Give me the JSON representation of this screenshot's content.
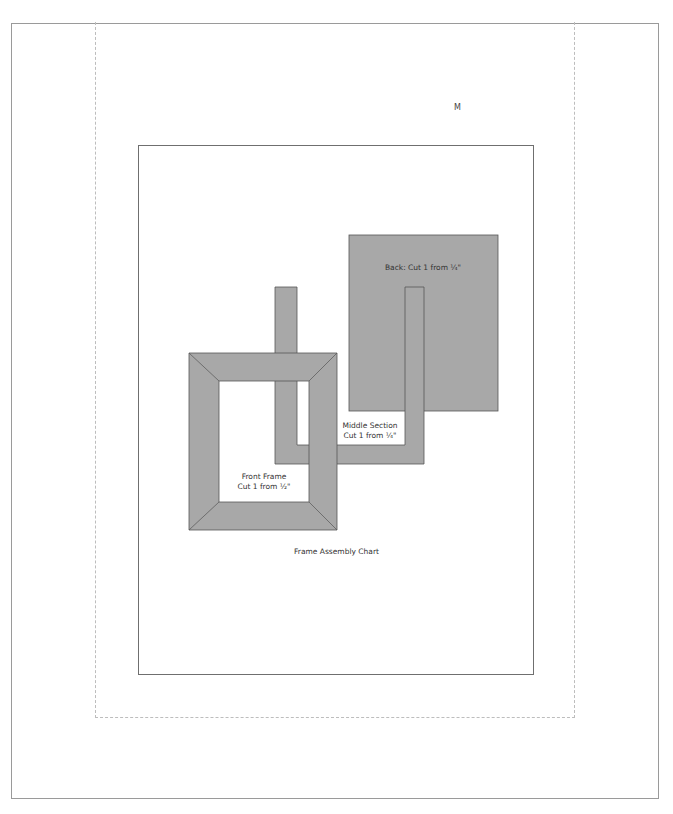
{
  "page": {
    "corner_marker": "M",
    "caption": "Frame Assembly Chart"
  },
  "parts": {
    "back": {
      "label": "Back: Cut 1 from ¼\""
    },
    "middle": {
      "label_line1": "Middle Section",
      "label_line2": "Cut 1 from ¼\""
    },
    "front": {
      "label_line1": "Front Frame",
      "label_line2": "Cut 1 from ½\""
    }
  },
  "colors": {
    "part_fill": "#a8a8a8",
    "part_stroke": "#555555",
    "border": "#9a9a9a",
    "dashed_guide": "#bdbdbd"
  }
}
